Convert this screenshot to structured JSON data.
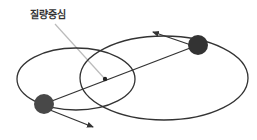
{
  "diagram": {
    "title_label": "질량중심",
    "colors": {
      "orbit_stroke": "#333333",
      "body_fill": "#3a3a3a",
      "pointer_line": "#bbbbbb",
      "background": "#ffffff"
    },
    "elements": {
      "small_orbit": {
        "cx": 76,
        "cy": 79,
        "rx": 59,
        "ry": 31
      },
      "large_orbit": {
        "cx": 164,
        "cy": 78,
        "rx": 84,
        "ry": 42
      },
      "barycenter": {
        "x": 105,
        "y": 79
      },
      "body_top_right": {
        "x": 198,
        "y": 45,
        "r": 10
      },
      "body_bottom_left": {
        "x": 44,
        "y": 104,
        "r": 10
      }
    }
  }
}
